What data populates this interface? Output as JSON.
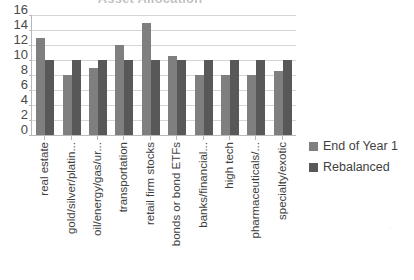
{
  "chart_data": {
    "type": "bar",
    "title": "Asset Allocation",
    "xlabel": "",
    "ylabel": "",
    "ylim": [
      0,
      16
    ],
    "yticks": [
      16,
      14,
      12,
      10,
      8,
      6,
      4,
      2,
      0
    ],
    "grid": true,
    "legend_position": "right",
    "categories": [
      "real estate",
      "gold/silver/platin...",
      "oil/energy/gas/ur...",
      "transportation",
      "retail firm stocks",
      "bonds or bond ETFs",
      "banks/financial...",
      "high tech",
      "pharmaceuticals/...",
      "specialty/exotic"
    ],
    "series": [
      {
        "name": "End of Year 1",
        "color": "#7f7f7f",
        "values": [
          13,
          8,
          9,
          12,
          15,
          10.5,
          8,
          8,
          8,
          8.5
        ]
      },
      {
        "name": "Rebalanced",
        "color": "#585858",
        "values": [
          10,
          10,
          10,
          10,
          10,
          10,
          10,
          10,
          10,
          10
        ]
      }
    ]
  },
  "legend": {
    "items": [
      {
        "label": "End of Year 1"
      },
      {
        "label": "Rebalanced"
      }
    ]
  },
  "artifact": {
    "text": "·"
  }
}
